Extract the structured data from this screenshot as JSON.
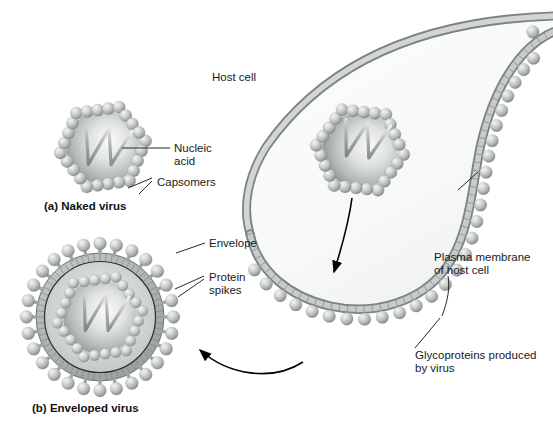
{
  "figure": {
    "title_visible": false,
    "background": "#ffffff",
    "palette": {
      "sphere_light": "#e8e8e8",
      "sphere_mid": "#b9bcbc",
      "sphere_dark": "#8c9090",
      "membrane_band": "#b5b8b8",
      "membrane_edge": "#6e7272",
      "capsid_interior_light": "#f2f2f2",
      "capsid_interior_dark": "#8e9292",
      "cell_interior": "#fbfbfb",
      "line": "#111111",
      "text": "#1a1a1a"
    }
  },
  "labels": {
    "host_cell": "Host cell",
    "nucleic_acid_line1": "Nucleic",
    "nucleic_acid_line2": "acid",
    "capsomers": "Capsomers",
    "envelope": "Envelope",
    "protein_spikes_line1": "Protein",
    "protein_spikes_line2": "spikes",
    "plasma_membrane_line1": "Plasma membrane",
    "plasma_membrane_line2": "of host cell",
    "glycoproteins_line1": "Glycoproteins produced",
    "glycoproteins_line2": "by virus"
  },
  "captions": {
    "a": "(a) Naked virus",
    "b": "(b) Enveloped virus"
  },
  "structures": {
    "naked_virus": {
      "name": "naked virus",
      "center": [
        103,
        147
      ],
      "radius": 47,
      "capsomer_count": 24,
      "has_envelope": false,
      "has_spikes": false,
      "contains_nucleic_acid": true
    },
    "enveloped_virus": {
      "name": "enveloped virus",
      "center": [
        100,
        317
      ],
      "outer_radius": 75,
      "envelope_radius": 62,
      "capsid_radius": 46,
      "spike_count": 28,
      "capsomer_count": 24,
      "has_envelope": true,
      "has_spikes": true,
      "contains_nucleic_acid": true
    },
    "budding_virus": {
      "name": "virus inside host cell",
      "center": [
        360,
        150
      ],
      "radius": 48,
      "capsomer_count": 24,
      "contains_nucleic_acid": true
    },
    "host_cell": {
      "name": "host cell with budding membrane",
      "membrane_thickness": 9,
      "glycoprotein_count": 30
    }
  },
  "arrows": [
    {
      "name": "budding-arrow",
      "from": [
        352,
        200
      ],
      "to": [
        333,
        275
      ],
      "style": "straight"
    },
    {
      "name": "release-arrow",
      "from": [
        300,
        360
      ],
      "to": [
        196,
        348
      ],
      "style": "curved"
    }
  ],
  "icons": {
    "nucleic_acid": "zigzag-strand-icon",
    "capsomer": "sphere-icon",
    "spike": "spike-icon",
    "membrane": "lipid-bilayer-icon"
  }
}
